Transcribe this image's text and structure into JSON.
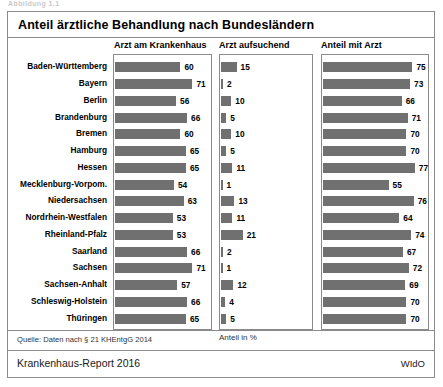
{
  "top_caption": "Abbildung 1.1",
  "figure": {
    "title": "Anteil ärztliche Behandlung nach Bundesländern",
    "axis_note": "Anteil in %",
    "source": "Quelle: Daten nach § 21 KHEntgG 2014",
    "report": "Krankenhaus-Report 2016",
    "publisher": "WIdO"
  },
  "chart_data": {
    "type": "bar",
    "orientation": "horizontal",
    "title": "Anteil ärztliche Behandlung nach Bundesländern",
    "xlabel": "Anteil in %",
    "ylabel": "",
    "grid": false,
    "legend": "none",
    "panels": [
      {
        "name": "Arzt am Krankenhaus",
        "xlim": [
          0,
          80
        ]
      },
      {
        "name": "Arzt aufsuchend",
        "xlim": [
          0,
          80
        ]
      },
      {
        "name": "Anteil mit Arzt",
        "xlim": [
          0,
          80
        ]
      }
    ],
    "categories": [
      "Baden-Württemberg",
      "Bayern",
      "Berlin",
      "Brandenburg",
      "Bremen",
      "Hamburg",
      "Hessen",
      "Mecklenburg-Vorpom.",
      "Niedersachsen",
      "Nordrhein-Westfalen",
      "Rheinland-Pfalz",
      "Saarland",
      "Sachsen",
      "Sachsen-Anhalt",
      "Schleswig-Holstein",
      "Thüringen"
    ],
    "series": [
      {
        "name": "Arzt am Krankenhaus",
        "values": [
          60,
          71,
          56,
          66,
          60,
          65,
          65,
          54,
          63,
          53,
          53,
          66,
          71,
          57,
          66,
          65
        ]
      },
      {
        "name": "Arzt aufsuchend",
        "values": [
          15,
          2,
          10,
          5,
          10,
          5,
          11,
          1,
          13,
          11,
          21,
          2,
          1,
          12,
          4,
          5
        ]
      },
      {
        "name": "Anteil mit Arzt",
        "values": [
          75,
          73,
          66,
          71,
          70,
          70,
          77,
          55,
          76,
          64,
          74,
          67,
          72,
          69,
          70,
          70
        ]
      }
    ],
    "units": "percent",
    "source": "Quelle: Daten nach § 21 KHEntgG 2014"
  }
}
